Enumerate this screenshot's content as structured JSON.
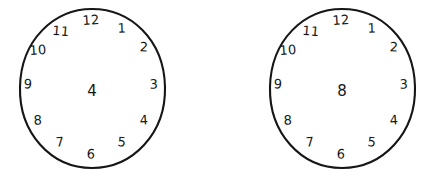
{
  "page": {
    "background_color": "#ffffff",
    "ink_color": "#161616"
  },
  "clocks": [
    {
      "name": "clock-left",
      "center_number": "4",
      "has_hands": false,
      "dial_numbers": [
        {
          "label": "12",
          "x": 74,
          "y": 13
        },
        {
          "label": "1",
          "x": 105,
          "y": 21
        },
        {
          "label": "2",
          "x": 127,
          "y": 40
        },
        {
          "label": "3",
          "x": 137,
          "y": 77
        },
        {
          "label": "4",
          "x": 127,
          "y": 113
        },
        {
          "label": "5",
          "x": 105,
          "y": 135
        },
        {
          "label": "6",
          "x": 74,
          "y": 147
        },
        {
          "label": "7",
          "x": 43,
          "y": 135
        },
        {
          "label": "8",
          "x": 21,
          "y": 113
        },
        {
          "label": "9",
          "x": 11,
          "y": 77
        },
        {
          "label": "10",
          "x": 21,
          "y": 43
        },
        {
          "label": "11",
          "x": 44,
          "y": 24
        }
      ]
    },
    {
      "name": "clock-right",
      "center_number": "8",
      "has_hands": false,
      "dial_numbers": [
        {
          "label": "12",
          "x": 74,
          "y": 13
        },
        {
          "label": "1",
          "x": 105,
          "y": 21
        },
        {
          "label": "2",
          "x": 127,
          "y": 40
        },
        {
          "label": "3",
          "x": 137,
          "y": 77
        },
        {
          "label": "4",
          "x": 127,
          "y": 113
        },
        {
          "label": "5",
          "x": 105,
          "y": 135
        },
        {
          "label": "6",
          "x": 74,
          "y": 147
        },
        {
          "label": "7",
          "x": 43,
          "y": 135
        },
        {
          "label": "8",
          "x": 21,
          "y": 113
        },
        {
          "label": "9",
          "x": 11,
          "y": 77
        },
        {
          "label": "10",
          "x": 21,
          "y": 43
        },
        {
          "label": "11",
          "x": 44,
          "y": 24
        }
      ]
    }
  ]
}
